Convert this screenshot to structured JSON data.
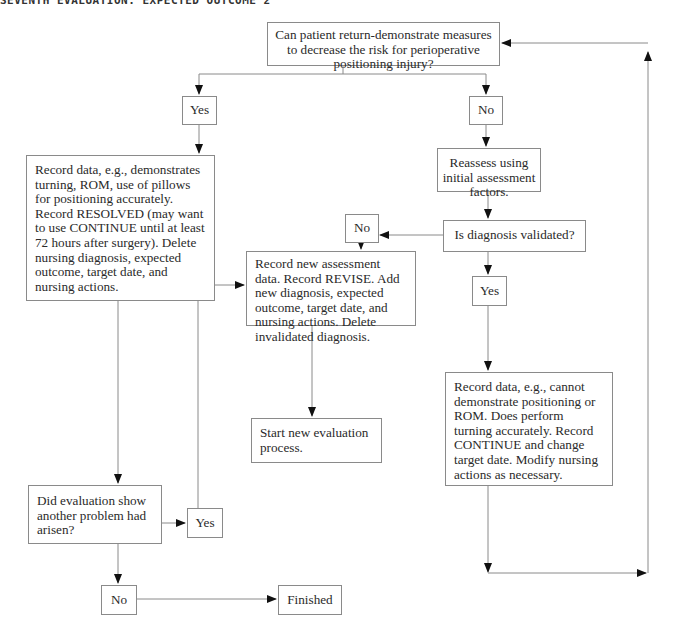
{
  "header": {
    "title": "SEVENTH EVALUATION: EXPECTED OUTCOME 2"
  },
  "nodes": {
    "question_main": "Can patient return-demonstrate measures to decrease the risk for perioperative positioning injury?",
    "yes_1": "Yes",
    "no_1": "No",
    "record_resolved": "Record data, e.g., demonstrates turning, ROM, use of pillows for positioning accurately. Record RESOLVED (may want to use CONTINUE until at least 72 hours after surgery). Delete nursing diagnosis, expected outcome, target date, and nursing actions.",
    "reassess": "Reassess using initial assessment factors.",
    "no_2": "No",
    "diagnosis_validated": "Is diagnosis validated?",
    "record_revise": "Record new assessment data. Record REVISE. Add new diagnosis, expected outcome, target date, and nursing actions. Delete invalidated diagnosis.",
    "yes_2": "Yes",
    "start_new_eval": "Start new evaluation process.",
    "record_continue": "Record data, e.g., cannot demonstrate positioning or ROM. Does perform turning accurately. Record CONTINUE and change target date. Modify nursing actions as necessary.",
    "another_problem": "Did evaluation show another problem had arisen?",
    "yes_3": "Yes",
    "no_3": "No",
    "finished": "Finished"
  },
  "colors": {
    "line": "#8a8a8a",
    "arrow": "#111111",
    "border": "#8a8a8a",
    "text": "#2a2a2a"
  }
}
